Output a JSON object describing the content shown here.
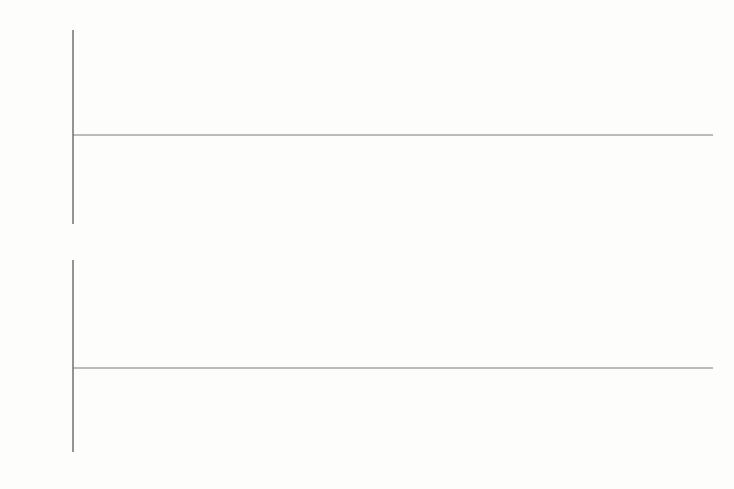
{
  "figure": {
    "title": "",
    "background_color": "#fdfdfc",
    "curve_color": "#222222",
    "axis_color": "#6b6b6b",
    "panel_count": 2
  },
  "chart_data": [
    {
      "type": "line",
      "panel": "top",
      "title": "",
      "xlabel": "",
      "ylabel": "",
      "xlim": [
        0,
        0.4
      ],
      "ylim": [
        -0.2,
        0.2
      ],
      "grid": false,
      "legend": null,
      "xticks": [
        0.1,
        0.2,
        0.3,
        0.4
      ],
      "xticklabels": [
        "0.1",
        "0.2",
        "0.3",
        "0.4"
      ],
      "yticks": [
        -0.2,
        -0.1,
        0.1,
        0.2
      ],
      "yticklabels": [
        "-0.2",
        "-0.1",
        "0.1",
        "0.2"
      ],
      "x_minor_tick_step": 0.02,
      "y_minor_tick_step": 0.02,
      "description": "Low-amplitude modulated chirp envelope rising at the right edge",
      "series": [
        {
          "name": "top-signal",
          "x": [
            0.0,
            0.005,
            0.01,
            0.015,
            0.02,
            0.025,
            0.03,
            0.035,
            0.04,
            0.045,
            0.05,
            0.055,
            0.06,
            0.065,
            0.07,
            0.075,
            0.08,
            0.085,
            0.09,
            0.095,
            0.1,
            0.105,
            0.11,
            0.115,
            0.12,
            0.125,
            0.13,
            0.135,
            0.14,
            0.145,
            0.15,
            0.16,
            0.17,
            0.18,
            0.19,
            0.2,
            0.21,
            0.22,
            0.23,
            0.24,
            0.25,
            0.26,
            0.27,
            0.28,
            0.29,
            0.3,
            0.31,
            0.32,
            0.33,
            0.34,
            0.35,
            0.36,
            0.37,
            0.38,
            0.39,
            0.4
          ],
          "y": [
            0.0,
            0.0,
            0.0,
            0.001,
            -0.001,
            0.002,
            -0.002,
            0.003,
            -0.002,
            0.004,
            -0.003,
            0.005,
            -0.004,
            0.006,
            -0.005,
            0.007,
            -0.005,
            0.006,
            -0.008,
            0.005,
            -0.009,
            0.002,
            -0.007,
            0.006,
            0.01,
            0.013,
            0.014,
            0.014,
            0.012,
            0.009,
            0.005,
            -0.003,
            -0.01,
            -0.016,
            -0.022,
            -0.026,
            -0.03,
            -0.033,
            -0.035,
            -0.036,
            -0.036,
            -0.035,
            -0.033,
            -0.03,
            -0.026,
            -0.021,
            -0.015,
            -0.008,
            0.0,
            0.009,
            0.019,
            0.03,
            0.042,
            0.055,
            0.07,
            0.087
          ]
        }
      ]
    },
    {
      "type": "line",
      "panel": "bottom",
      "title": "",
      "xlabel": "",
      "ylabel": "",
      "xlim": [
        0,
        0.4
      ],
      "ylim": [
        -1.15,
        1.2
      ],
      "grid": false,
      "legend": null,
      "xticks": [
        0.1,
        0.2,
        0.3,
        0.4
      ],
      "xticklabels": [
        "0.1",
        "0.2",
        "0.3",
        "0.4"
      ],
      "yticks": [
        -1.0,
        -0.5,
        0.5,
        1.0
      ],
      "yticklabels": [
        "-1.0",
        "-0.5",
        "0.5",
        "1.0"
      ],
      "x_minor_tick_step": 0.02,
      "y_minor_tick_step": 0.1,
      "description": "Chirp signal with instantaneous frequency decreasing with x; dense unresolved oscillation near x=0, last oscillation minimum near x=0.165, zero crossing near x=0.235, saturating toward 1.15 at x=0.4",
      "series": [
        {
          "name": "chirp-signal",
          "form": "sin(phase(x)) saturating",
          "zero_crossings": [
            0.022,
            0.028,
            0.034,
            0.041,
            0.049,
            0.058,
            0.069,
            0.082,
            0.097,
            0.135,
            0.235
          ],
          "maxima_x": [
            0.0455,
            0.0535,
            0.0635,
            0.0755,
            0.109
          ],
          "minima_x": [
            0.0495,
            0.0585,
            0.0695,
            0.0835,
            0.165
          ],
          "amplitude": 1.0,
          "final_value": 1.15
        }
      ]
    }
  ],
  "axes_labels": {
    "top": {
      "y": [
        "0.2",
        "0.1",
        "-0.1",
        "-0.2"
      ],
      "x": [
        "0.1",
        "0.2",
        "0.3",
        "0.4"
      ]
    },
    "bottom": {
      "y": [
        "1.0",
        "0.5",
        "-0.5",
        "-1.0"
      ],
      "x": [
        "0.1",
        "0.2",
        "0.3",
        "0.4"
      ]
    }
  }
}
